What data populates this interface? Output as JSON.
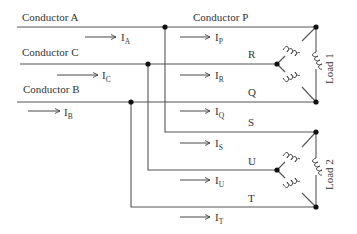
{
  "conductors": {
    "a": {
      "label": "Conductor A",
      "current": "I",
      "sub": "A"
    },
    "c": {
      "label": "Conductor C",
      "current": "I",
      "sub": "C"
    },
    "b": {
      "label": "Conductor B",
      "current": "I",
      "sub": "B"
    }
  },
  "load1": {
    "label": "Load 1",
    "lines": [
      {
        "label": "Conductor P",
        "current": "I",
        "sub": "P"
      },
      {
        "label": "R",
        "current": "I",
        "sub": "R"
      },
      {
        "label": "Q",
        "current": "I",
        "sub": "Q"
      }
    ]
  },
  "load2": {
    "label": "Load 2",
    "lines": [
      {
        "label": "S",
        "current": "I",
        "sub": "S"
      },
      {
        "label": "U",
        "current": "I",
        "sub": "U"
      },
      {
        "label": "T",
        "current": "I",
        "sub": "T"
      }
    ]
  },
  "colors": {
    "wire": "#555555",
    "node": "#111111",
    "text": "#333333"
  }
}
